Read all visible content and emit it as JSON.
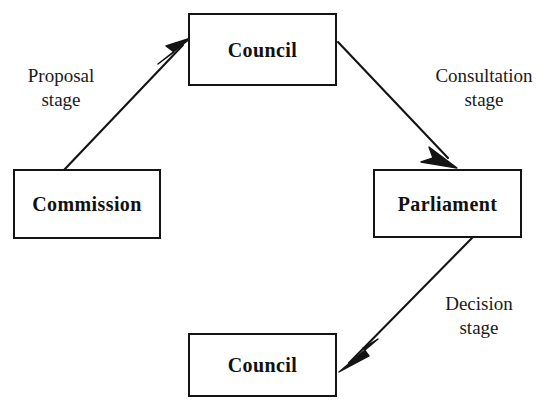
{
  "diagram": {
    "background_color": "#ffffff",
    "line_color": "#141414",
    "text_color": "#111111",
    "nodes": [
      {
        "id": "council-top",
        "label": "Council",
        "x": 188,
        "y": 13,
        "w": 149,
        "h": 73
      },
      {
        "id": "commission",
        "label": "Commission",
        "x": 13,
        "y": 169,
        "w": 148,
        "h": 70
      },
      {
        "id": "parliament",
        "label": "Parliament",
        "x": 373,
        "y": 169,
        "w": 149,
        "h": 69
      },
      {
        "id": "council-bottom",
        "label": "Council",
        "x": 188,
        "y": 333,
        "w": 149,
        "h": 64
      }
    ],
    "edges": [
      {
        "id": "proposal",
        "from": "commission",
        "to": "council-top",
        "label_line1": "Proposal",
        "label_line2": "stage",
        "x1": 64,
        "y1": 170,
        "x2": 191,
        "y2": 38
      },
      {
        "id": "consultation",
        "from": "council-top",
        "to": "parliament",
        "label_line1": "Consultation",
        "label_line2": "stage",
        "x1": 338,
        "y1": 42,
        "x2": 456,
        "y2": 167
      },
      {
        "id": "decision",
        "from": "parliament",
        "to": "council-bottom",
        "label_line1": "Decision",
        "label_line2": "stage",
        "x1": 472,
        "y1": 238,
        "x2": 340,
        "y2": 372
      }
    ],
    "labels": {
      "proposal": {
        "text_line1": "Proposal",
        "text_line2": "stage",
        "x": 8,
        "y": 64,
        "w": 106
      },
      "consultation": {
        "text_line1": "Consultation",
        "text_line2": "stage",
        "x": 421,
        "y": 64,
        "w": 126
      },
      "decision": {
        "text_line1": "Decision",
        "text_line2": "stage",
        "x": 424,
        "y": 292,
        "w": 110
      }
    }
  }
}
